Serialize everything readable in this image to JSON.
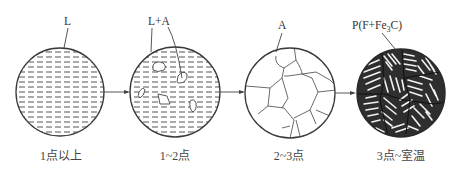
{
  "stages": [
    {
      "id": "stage-1",
      "phase_label": "L",
      "caption": "1点以上"
    },
    {
      "id": "stage-2",
      "phase_label": "L+A",
      "caption": "1~2点"
    },
    {
      "id": "stage-3",
      "phase_label": "A",
      "caption": "2~3点"
    },
    {
      "id": "stage-4",
      "phase_label": "P(F+Fe",
      "phase_sub": "3",
      "phase_end": "C)",
      "caption": "3点~室温"
    }
  ],
  "colors": {
    "line": "#3a3a3a",
    "background": "#ffffff"
  }
}
